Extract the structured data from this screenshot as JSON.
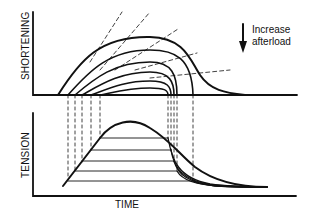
{
  "diagram": {
    "top_panel": {
      "ylabel": "SHORTENING"
    },
    "bottom_panel": {
      "ylabel": "TENSION",
      "xlabel": "TIME"
    },
    "annotation": {
      "line1": "Increase",
      "line2": "afterload",
      "arrow": "down-arrow-icon"
    },
    "afterload_levels": 5,
    "colors": {
      "ink": "#111111",
      "background": "#ffffff"
    }
  }
}
